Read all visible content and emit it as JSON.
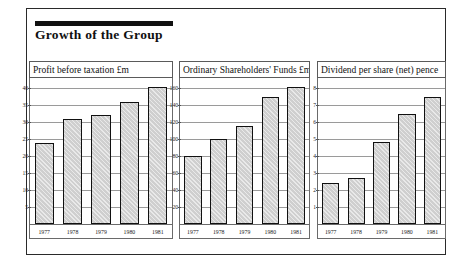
{
  "document": {
    "heading": "Growth of the Group"
  },
  "chart_data": [
    {
      "type": "bar",
      "title": "Profit before taxation £m",
      "xlabel": "",
      "ylabel": "",
      "categories": [
        "1977",
        "1978",
        "1979",
        "1980",
        "1981"
      ],
      "values": [
        24,
        31,
        32,
        36,
        40.5
      ],
      "yticks": [
        5,
        10,
        15,
        20,
        25,
        30,
        35,
        40
      ],
      "ylim": [
        0,
        43
      ],
      "grid": true,
      "legend": "none"
    },
    {
      "type": "bar",
      "title": "Ordinary Shareholders' Funds £m",
      "xlabel": "",
      "ylabel": "",
      "categories": [
        "1977",
        "1978",
        "1979",
        "1980",
        "1981"
      ],
      "values": [
        80,
        100,
        115,
        150,
        162
      ],
      "yticks": [
        20,
        40,
        60,
        80,
        100,
        120,
        140,
        160
      ],
      "ylim": [
        0,
        172
      ],
      "grid": true,
      "legend": "none"
    },
    {
      "type": "bar",
      "title": "Dividend per share (net) pence",
      "xlabel": "",
      "ylabel": "",
      "categories": [
        "1977",
        "1978",
        "1979",
        "1980",
        "1981"
      ],
      "values": [
        2.4,
        2.7,
        4.85,
        6.5,
        7.5
      ],
      "yticks": [
        1,
        2,
        3,
        4,
        5,
        6,
        7,
        8
      ],
      "ylim": [
        0,
        8.6
      ],
      "grid": true,
      "legend": "none"
    }
  ]
}
